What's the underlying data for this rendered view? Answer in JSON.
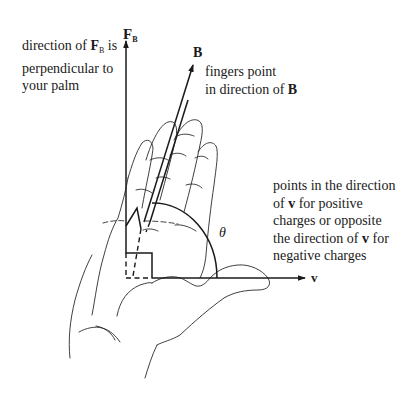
{
  "diagram": {
    "vectors": {
      "force": {
        "symbol": "F",
        "subscript": "B"
      },
      "field": {
        "symbol": "B"
      },
      "velocity": {
        "symbol": "v"
      },
      "angle": {
        "symbol": "θ"
      }
    },
    "annotations": {
      "force_note": {
        "line1_pre": "direction of ",
        "line1_vec": "F",
        "line1_sub": "B",
        "line1_post": " is",
        "line2": "perpendicular to",
        "line3": "your palm"
      },
      "field_note": {
        "line1": "fingers point",
        "line2_pre": "in direction of ",
        "line2_vec": "B"
      },
      "thumb_note": {
        "line1": "points in the direction",
        "line2_pre": "of ",
        "line2_vec": "v",
        "line2_post": " for positive",
        "line3": "charges or opposite",
        "line4_pre": "the direction of ",
        "line4_vec": "v",
        "line4_post": " for",
        "line5": "negative charges"
      }
    },
    "colors": {
      "ink": "#1a1a1a",
      "background": "#ffffff"
    }
  }
}
